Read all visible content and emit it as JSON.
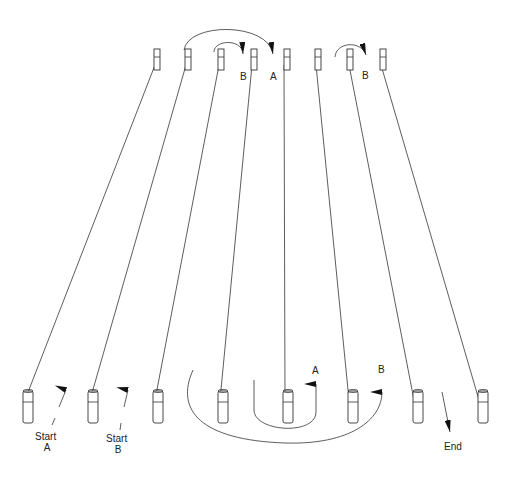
{
  "diagram": {
    "top_row": {
      "cones_x": [
        157,
        188,
        221,
        254,
        287,
        318,
        350,
        383
      ],
      "y": 49,
      "labels": [
        {
          "text": "B",
          "x": 243,
          "y": 76
        },
        {
          "text": "A",
          "x": 273,
          "y": 76
        },
        {
          "text": "B",
          "x": 366,
          "y": 75
        }
      ]
    },
    "bottom_row": {
      "cones_x": [
        28,
        93,
        158,
        223,
        288,
        353,
        418,
        483
      ],
      "y": 390,
      "labels": [
        {
          "text": "A",
          "x": 316,
          "y": 374
        },
        {
          "text": "B",
          "x": 382,
          "y": 373
        }
      ]
    },
    "start_a": {
      "line1": "Start",
      "line2": "A"
    },
    "start_b": {
      "line1": "Start",
      "line2": "B"
    },
    "end": {
      "label": "End"
    }
  }
}
